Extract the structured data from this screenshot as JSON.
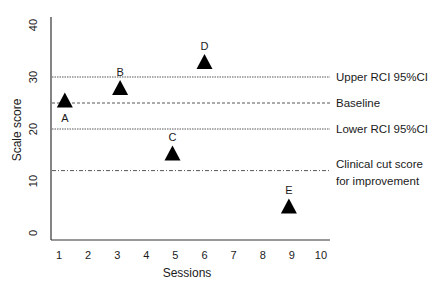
{
  "chart_data": {
    "type": "scatter",
    "title": "",
    "xlabel": "Sessions",
    "ylabel": "Scale score",
    "xlim": [
      1,
      10
    ],
    "ylim": [
      0,
      40
    ],
    "x_ticks": [
      "1",
      "2",
      "3",
      "4",
      "5",
      "6",
      "7",
      "8",
      "9",
      "10"
    ],
    "y_ticks": [
      "0",
      "10",
      "20",
      "30",
      "40"
    ],
    "grid": false,
    "marker": "triangle",
    "points": [
      {
        "label": "A",
        "x": 1.2,
        "y": 25.6
      },
      {
        "label": "B",
        "x": 3.1,
        "y": 28.0
      },
      {
        "label": "C",
        "x": 4.9,
        "y": 15.4
      },
      {
        "label": "D",
        "x": 6.0,
        "y": 33.0
      },
      {
        "label": "E",
        "x": 8.9,
        "y": 5.2
      }
    ],
    "reference_lines": [
      {
        "label": "Upper RCI 95%CI",
        "y": 30,
        "style": "dotted"
      },
      {
        "label": "Baseline",
        "y": 25,
        "style": "dashed"
      },
      {
        "label": "Lower RCI 95%CI",
        "y": 20,
        "style": "dotted"
      },
      {
        "label": "Clinical cut score for improvement",
        "label_lines": [
          "Clinical cut score",
          "for improvement"
        ],
        "y": 12,
        "style": "dash-dot"
      }
    ],
    "colors": {
      "marker": "#000000",
      "axis": "#333333",
      "lines": "#444444",
      "text": "#1a1a1a"
    }
  }
}
